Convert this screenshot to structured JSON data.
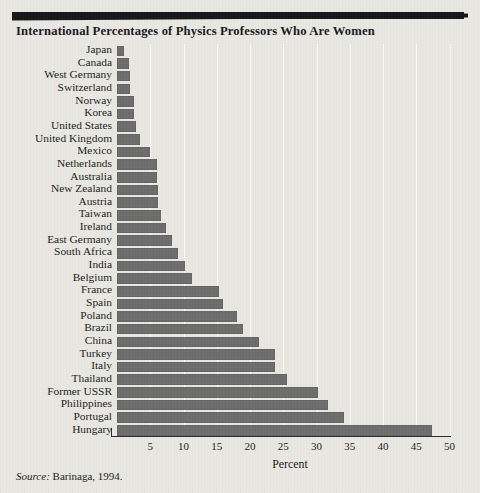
{
  "title": "International Percentages of Physics Professors Who Are Women",
  "source_prefix": "Source:",
  "source_text": "Barinaga, 1994.",
  "colors": {
    "bar": "#6c6c6c",
    "rule": "#15161a",
    "paper": "#e9e8e3",
    "grid": "#fbfbf9",
    "text": "#1b1c20"
  },
  "chart_data": {
    "type": "bar",
    "orientation": "horizontal",
    "title": "International Percentages of Physics Professors Who Are Women",
    "xlabel": "Percent",
    "ylabel": "",
    "xlim": [
      0,
      51
    ],
    "xticks": [
      5,
      10,
      15,
      20,
      25,
      30,
      35,
      40,
      45,
      50
    ],
    "xticklabels": [
      "5",
      "10",
      "15",
      "20",
      "25",
      "30",
      "35",
      "40",
      "45",
      "50"
    ],
    "grid": "vertical",
    "legend": "none",
    "categories": [
      "Japan",
      "Canada",
      "West Germany",
      "Switzerland",
      "Norway",
      "Korea",
      "United States",
      "United Kingdom",
      "Mexico",
      "Netherlands",
      "Australia",
      "New Zealand",
      "Austria",
      "Taiwan",
      "Ireland",
      "East Germany",
      "South Africa",
      "India",
      "Belgium",
      "France",
      "Spain",
      "Poland",
      "Brazil",
      "China",
      "Turkey",
      "Italy",
      "Thailand",
      "Former USSR",
      "Philippines",
      "Portugal",
      "Hungary"
    ],
    "values": [
      1.0,
      1.8,
      2.0,
      1.9,
      2.6,
      2.6,
      2.8,
      3.5,
      5.0,
      6.0,
      6.0,
      6.1,
      6.1,
      6.6,
      7.3,
      8.3,
      9.1,
      10.3,
      11.3,
      15.4,
      16.0,
      18.0,
      18.9,
      21.3,
      23.7,
      23.7,
      25.5,
      30.3,
      31.7,
      34.1,
      47.3
    ]
  }
}
